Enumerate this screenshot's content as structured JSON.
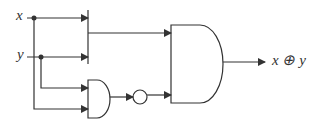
{
  "diagram": {
    "type": "logic-circuit",
    "inputs": [
      {
        "label": "x"
      },
      {
        "label": "y"
      }
    ],
    "output": {
      "label": "x ⊕ y"
    },
    "components": [
      {
        "id": "or-gate",
        "kind": "OR (bar)",
        "inputs": [
          "x",
          "y"
        ]
      },
      {
        "id": "and-gate-small",
        "kind": "AND",
        "inputs": [
          "y",
          "x"
        ]
      },
      {
        "id": "not-gate",
        "kind": "NOT (bubble)",
        "input": "and-gate-small"
      },
      {
        "id": "and-gate-large",
        "kind": "AND",
        "inputs": [
          "or-gate",
          "not-gate"
        ],
        "output": "x ⊕ y"
      }
    ],
    "colors": {
      "stroke": "#333333",
      "background": "#ffffff"
    }
  }
}
